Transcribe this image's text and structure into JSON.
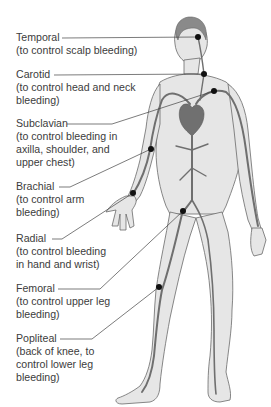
{
  "diagram": {
    "colors": {
      "skin": "#e6e6e6",
      "outline": "#6a6a6a",
      "artery": "#6f6f6f",
      "hair": "#8a8a8a",
      "heart": "#707070",
      "dot": "#111111",
      "leader": "#444444",
      "text": "#3c3c3c"
    },
    "points": [
      {
        "name": "Temporal",
        "desc": "(to control scalp bleeding)",
        "label_top": 31,
        "line_y": 38,
        "line_x0": 62,
        "dot": [
          198,
          37
        ]
      },
      {
        "name": "Carotid",
        "desc": "(to control head and neck\nbleeding)",
        "label_top": 68,
        "line_y": 75,
        "line_x0": 54,
        "dot": [
          204,
          74
        ]
      },
      {
        "name": "Subclavian",
        "desc": "(to control bleeding in\naxilla, shoulder, and\nupper chest)",
        "label_top": 117,
        "line_y": 124,
        "line_x0": 67,
        "dot": [
          214,
          91
        ]
      },
      {
        "name": "Brachial",
        "desc": "(to control arm\nbleeding)",
        "label_top": 180,
        "line_y": 187,
        "line_x0": 59,
        "dot": [
          151,
          149
        ]
      },
      {
        "name": "Radial",
        "desc": "(to control bleeding\nin hand and wrist)",
        "label_top": 232,
        "line_y": 239,
        "line_x0": 52,
        "dot": [
          133,
          193
        ]
      },
      {
        "name": "Femoral",
        "desc": "(to control upper leg\nbleeding)",
        "label_top": 282,
        "line_y": 289,
        "line_x0": 58,
        "dot": [
          183,
          211
        ]
      },
      {
        "name": "Popliteal",
        "desc": "(back of knee, to\ncontrol lower leg\nbleeding)",
        "label_top": 332,
        "line_y": 339,
        "line_x0": 60,
        "dot": [
          159,
          287
        ]
      }
    ]
  }
}
